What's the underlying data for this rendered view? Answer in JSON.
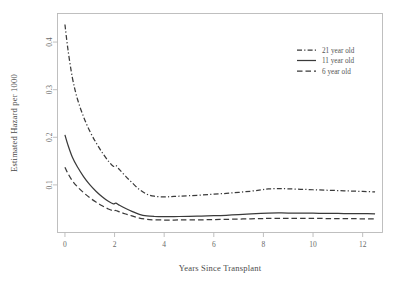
{
  "chart_data": {
    "type": "line",
    "title": "",
    "xlabel": "Years Since Transplant",
    "ylabel": "Estimated Hazard per 1000",
    "xlim": [
      -0.3,
      12.8
    ],
    "ylim": [
      0.0,
      0.46
    ],
    "xticks": [
      "0",
      "2",
      "4",
      "6",
      "8",
      "10",
      "12"
    ],
    "xtick_values": [
      0,
      2,
      4,
      6,
      8,
      10,
      12
    ],
    "yticks": [
      "0.1",
      "0.2",
      "0.3",
      "0.4"
    ],
    "ytick_values": [
      0.1,
      0.2,
      0.3,
      0.4
    ],
    "grid": false,
    "legend_position": "top-right",
    "frame": "box",
    "series": [
      {
        "name": "21 year old",
        "style": "dashdot",
        "color": "#3a3a3a",
        "x": [
          0.0,
          0.12,
          0.3,
          0.5,
          0.75,
          1.0,
          1.25,
          1.5,
          1.75,
          1.95,
          2.05,
          2.2,
          2.45,
          2.7,
          3.0,
          3.3,
          3.6,
          4.0,
          4.3,
          4.6,
          5.0,
          5.5,
          6.0,
          6.5,
          7.0,
          7.5,
          7.9,
          8.2,
          8.6,
          9.0,
          9.5,
          10.0,
          10.5,
          11.0,
          11.5,
          12.0,
          12.5
        ],
        "y": [
          0.437,
          0.385,
          0.325,
          0.281,
          0.243,
          0.213,
          0.189,
          0.168,
          0.15,
          0.139,
          0.141,
          0.132,
          0.118,
          0.105,
          0.0905,
          0.0805,
          0.0762,
          0.0748,
          0.0755,
          0.0762,
          0.0772,
          0.0788,
          0.0805,
          0.0822,
          0.0843,
          0.0868,
          0.0895,
          0.0915,
          0.0921,
          0.0918,
          0.0908,
          0.0898,
          0.0889,
          0.088,
          0.0871,
          0.0862,
          0.0852
        ]
      },
      {
        "name": "11 year old",
        "style": "solid",
        "color": "#3a3a3a",
        "x": [
          0.0,
          0.12,
          0.3,
          0.5,
          0.75,
          1.0,
          1.25,
          1.5,
          1.75,
          1.95,
          2.05,
          2.2,
          2.45,
          2.7,
          3.0,
          3.3,
          3.6,
          4.0,
          4.3,
          4.6,
          5.0,
          5.5,
          6.0,
          6.5,
          7.0,
          7.5,
          7.9,
          8.2,
          8.6,
          9.0,
          9.5,
          10.0,
          10.5,
          11.0,
          11.5,
          12.0,
          12.5
        ],
        "y": [
          0.205,
          0.184,
          0.158,
          0.138,
          0.1175,
          0.1005,
          0.0868,
          0.0752,
          0.0655,
          0.06,
          0.0617,
          0.0572,
          0.0505,
          0.0445,
          0.0382,
          0.0348,
          0.0336,
          0.0332,
          0.0334,
          0.0336,
          0.0339,
          0.0345,
          0.0352,
          0.0362,
          0.0375,
          0.039,
          0.0402,
          0.0408,
          0.041,
          0.0409,
          0.0407,
          0.0405,
          0.0403,
          0.04,
          0.0398,
          0.0395,
          0.0392
        ]
      },
      {
        "name": "6 year old",
        "style": "dashed",
        "color": "#3a3a3a",
        "x": [
          0.0,
          0.12,
          0.3,
          0.5,
          0.75,
          1.0,
          1.25,
          1.5,
          1.75,
          1.95,
          2.05,
          2.2,
          2.45,
          2.7,
          3.0,
          3.3,
          3.6,
          4.0,
          4.3,
          4.6,
          5.0,
          5.5,
          6.0,
          6.5,
          7.0,
          7.5,
          7.9,
          8.2,
          8.6,
          9.0,
          9.5,
          10.0,
          10.5,
          11.0,
          11.5,
          12.0,
          12.5
        ],
        "y": [
          0.137,
          0.124,
          0.1085,
          0.0962,
          0.0838,
          0.073,
          0.064,
          0.0562,
          0.0494,
          0.0455,
          0.0462,
          0.0432,
          0.0388,
          0.0348,
          0.0303,
          0.0277,
          0.0266,
          0.0262,
          0.0262,
          0.0263,
          0.0264,
          0.0267,
          0.0271,
          0.0276,
          0.0282,
          0.0288,
          0.0293,
          0.0296,
          0.0298,
          0.0298,
          0.0297,
          0.0296,
          0.0294,
          0.0292,
          0.029,
          0.0288,
          0.0286
        ]
      }
    ]
  },
  "legend": {
    "entries": [
      {
        "label": "21 year old",
        "style": "dashdot"
      },
      {
        "label": "11 year old",
        "style": "solid"
      },
      {
        "label": "6 year old",
        "style": "dashed"
      }
    ]
  }
}
